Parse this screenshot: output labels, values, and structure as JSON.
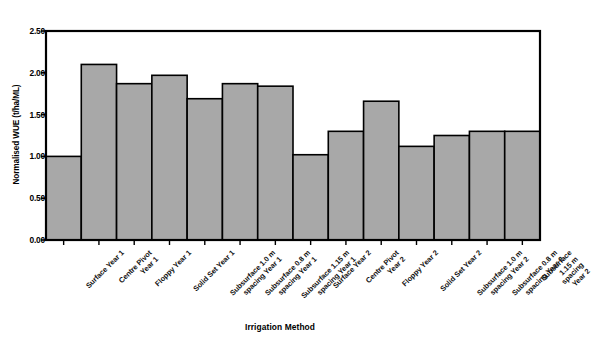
{
  "chart_data": {
    "type": "bar",
    "title": "",
    "xlabel": "Irrigation Method",
    "ylabel": "Normalised WUE (t/ha/ML)",
    "ylim": [
      0.0,
      2.5
    ],
    "ytick_labels": [
      "0.00",
      "0.50",
      "1.00",
      "1.50",
      "2.00",
      "2.50"
    ],
    "ytick_values": [
      0.0,
      0.5,
      1.0,
      1.5,
      2.0,
      2.5
    ],
    "grid": false,
    "legend": "none",
    "bar_fill": "#a8a8a8",
    "bar_edge": "#000000",
    "plot_bg": "#ffffff",
    "frame_color": "#000000",
    "categories": [
      "Surface Year 1",
      "Centre Pivot\nYear 1",
      "Floppy Year 1",
      "Solid Set Year 1",
      "Subsurface 1.0 m\nspacing Year 1",
      "Subsurface 0.8 m\nspacing Year 1",
      "Subsurface 1.15 m\nspacing Year 1",
      "Surface Year 2",
      "Centre Pivot\nYear 2",
      "Floppy Year 2",
      "Solid Set Year 2",
      "Subsurface 1.0 m\nspacing Year 2",
      "Subsurface 0.8 m\nspacing Year 2",
      "Subsurface 1.15 m\nspacing Year 2"
    ],
    "values": [
      1.0,
      2.1,
      1.87,
      1.97,
      1.69,
      1.87,
      1.84,
      1.02,
      1.3,
      1.66,
      1.12,
      1.25,
      1.3,
      1.3
    ]
  }
}
